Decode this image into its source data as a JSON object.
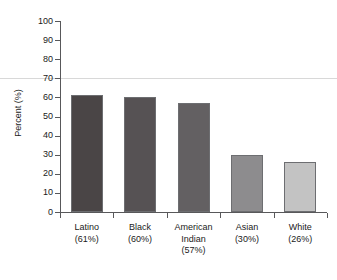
{
  "chart_data": {
    "type": "bar",
    "title": "",
    "subtitle": "",
    "xlabel": "",
    "ylabel": "Percent (%)",
    "ylim": [
      0,
      100
    ],
    "ytick_step": 10,
    "ytick_labels": [
      "100",
      "90",
      "80",
      "70",
      "60",
      "50",
      "40",
      "30",
      "20",
      "10",
      "0"
    ],
    "grid": false,
    "legend": null,
    "categories": [
      "Latino",
      "Black",
      "American Indian",
      "Asian",
      "White"
    ],
    "category_label_lines": [
      [
        "Latino",
        "(61%)"
      ],
      [
        "Black",
        "(60%)"
      ],
      [
        "American",
        "Indian",
        "(57%)"
      ],
      [
        "Asian",
        "(30%)"
      ],
      [
        "White",
        "(26%)"
      ]
    ],
    "values": [
      61,
      60,
      57,
      30,
      26
    ],
    "value_labels": [
      "(61%)",
      "(60%)",
      "(57%)",
      "(30%)",
      "(26%)"
    ],
    "bar_colors": [
      "#4a4546",
      "#565254",
      "#636062",
      "#8d8c8e",
      "#c3c3c3"
    ],
    "bar_border_color": "#6d6e71",
    "axis_color": "#58585a",
    "text_color": "#1a1a1a",
    "artifact_rule_color": "#d8d8d8",
    "artifact_rule_value": 70
  }
}
